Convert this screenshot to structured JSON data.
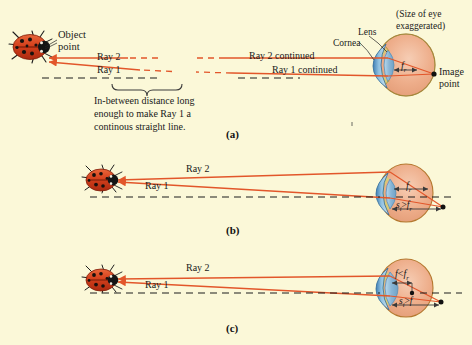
{
  "figure": {
    "background_color": "#fbf8d8",
    "ray_color": "#e2562a",
    "text_color": "#1a1a1a"
  },
  "panel_a": {
    "letter": "(a)",
    "object_point_label": "Object\npoint",
    "object_point_line1": "Object",
    "object_point_line2": "point",
    "ray2_label": "Ray 2",
    "ray1_label": "Ray 1",
    "ray2_continued_label": "Ray 2 continued",
    "ray1_continued_label": "Ray 1 continued",
    "brace_caption_line1": "In-between distance long",
    "brace_caption_line2": "enough to make Ray 1 a",
    "brace_caption_line3": "continous straight line.",
    "lens_label": "Lens",
    "cornea_label": "Cornea",
    "size_note_line1": "(Size of eye",
    "size_note_line2": "exaggerated)",
    "image_point_line1": "Image",
    "image_point_line2": "point",
    "focal_symbol": "f",
    "focal_subscript": "r"
  },
  "panel_b": {
    "letter": "(b)",
    "ray2_label": "Ray 2",
    "ray1_label": "Ray 1",
    "focal_symbol": "f",
    "focal_subscript": "r",
    "distance_symbol": "s",
    "distance_subscript": "i",
    "distance_relation": ">",
    "distance_compare_symbol": "f",
    "distance_compare_subscript": "r"
  },
  "panel_c": {
    "letter": "(c)",
    "ray2_label": "Ray 2",
    "ray1_label": "Ray 1",
    "focal_symbol": "f",
    "focal_relation": "<",
    "focal_compare_symbol": "f",
    "focal_compare_subscript": "r",
    "distance_symbol": "s",
    "distance_subscript": "i",
    "distance_relation": ">",
    "distance_compare_symbol": "f"
  }
}
